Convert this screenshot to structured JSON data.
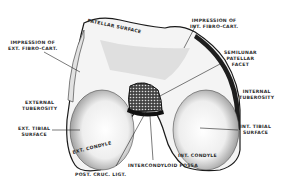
{
  "figure": {
    "labels": {
      "patellar_surface": "PATELLAR SURFACE",
      "impression_ext_fibro": [
        "IMPRESSION OF",
        "EXT. FIBRO-CART."
      ],
      "impression_int_fibro": [
        "IMPRESSION OF",
        "INT. FIBRO-CART."
      ],
      "semilunar_patellar_facet": [
        "SEMILUNAR",
        "PATELLAR",
        "FACET"
      ],
      "internal_tuberosity": [
        "INTERNAL",
        "TUBEROSITY"
      ],
      "external_tuberosity": [
        "EXTERNAL",
        "TUBEROSITY"
      ],
      "ext_tibial_surface": [
        "EXT. TIBIAL",
        "SURFACE"
      ],
      "int_tibial_surface": [
        "INT. TIBIAL",
        "SURFACE"
      ],
      "ext_condyle": "EXT. CONDYLE",
      "int_condyle": "INT. CONDYLE",
      "intercondyloid_fossa": "INTERCONDYLOID FOSSA",
      "post_cruc_ligt": "POST. CRUC. LIGT."
    },
    "colors": {
      "ink": "#1a1a1a",
      "paper": "#ffffff",
      "shade": "#9a9a9a"
    }
  }
}
